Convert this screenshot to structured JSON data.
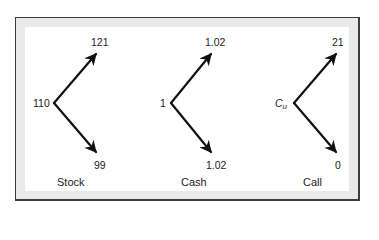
{
  "diagram": {
    "type": "binomial-tree-payoffs",
    "colors": {
      "frame_border": "#3c3c3c",
      "frame_band": "#e9e9e9",
      "background": "#ffffff",
      "arrow": "#111111"
    },
    "trees": [
      {
        "caption": "Stock",
        "root": "110",
        "up": "121",
        "down": "99"
      },
      {
        "caption": "Cash",
        "root": "1",
        "up": "1.02",
        "down": "1.02"
      },
      {
        "caption": "Call",
        "root_symbol": "C",
        "root_subscript": "u",
        "up": "21",
        "down": "0"
      }
    ]
  }
}
